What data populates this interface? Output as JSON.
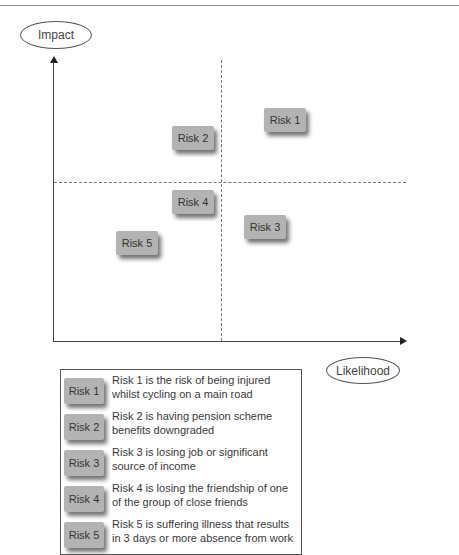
{
  "chart": {
    "y_axis_label": "Impact",
    "x_axis_label": "Likelihood",
    "quadrant_dividers": {
      "vertical": "dashed",
      "horizontal": "dashed"
    },
    "risks": [
      {
        "id": "risk1",
        "label": "Risk 1",
        "quadrant": "high likelihood / high impact"
      },
      {
        "id": "risk2",
        "label": "Risk 2",
        "quadrant": "low likelihood / high impact"
      },
      {
        "id": "risk3",
        "label": "Risk 3",
        "quadrant": "high likelihood / low impact"
      },
      {
        "id": "risk4",
        "label": "Risk 4",
        "quadrant": "low likelihood / low impact"
      },
      {
        "id": "risk5",
        "label": "Risk 5",
        "quadrant": "low likelihood / low impact"
      }
    ]
  },
  "legend": {
    "items": [
      {
        "label": "Risk 1",
        "description": "Risk 1 is the risk of being injured whilst cycling on a main road"
      },
      {
        "label": "Risk 2",
        "description": "Risk 2 is having pension scheme benefits downgraded"
      },
      {
        "label": "Risk 3",
        "description": "Risk 3 is losing job or significant source of income"
      },
      {
        "label": "Risk 4",
        "description": "Risk 4 is losing the friendship of one of the group of close friends"
      },
      {
        "label": "Risk 5",
        "description": "Risk 5 is suffering illness that results in 3 days or more absence from work"
      }
    ]
  },
  "colors": {
    "risk_box": "#b3b3b3",
    "axis": "#444444",
    "text": "#3a3a3a"
  }
}
